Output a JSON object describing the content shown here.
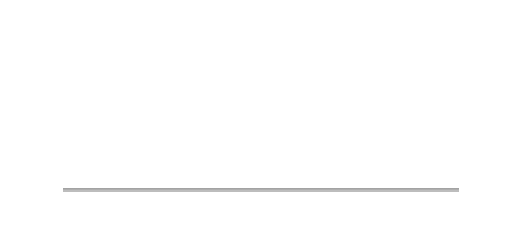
{
  "chart_data": {
    "type": "bar",
    "title": "",
    "xlabel": "",
    "ylabel": "",
    "grid": true,
    "legend": false,
    "categories": [
      "1986",
      "1987",
      "1988",
      "1989",
      "1990",
      "1991",
      "1992",
      "1993",
      "1994",
      "1995",
      "1996",
      "1997",
      "1998",
      "1999",
      "2000",
      "2001",
      "2002",
      "2003",
      "2004",
      "2005",
      "2006",
      "2007",
      "2008"
    ],
    "series": [
      {
        "name": "Average price",
        "render": "bar",
        "axis": "left",
        "unit": "GBP",
        "values": [
          47000,
          60000,
          81000,
          82000,
          70000,
          68000,
          62000,
          62000,
          66000,
          65000,
          69000,
          71000,
          78000,
          88000,
          100000,
          113000,
          131000,
          152000,
          168000,
          175000,
          193000,
          222000,
          185000
        ]
      },
      {
        "name": "Price per thousand",
        "render": "line",
        "axis": "right",
        "unit": "GBP/thousand",
        "values": [
          175,
          186,
          196,
          193,
          180,
          172,
          163,
          160,
          168,
          176,
          184,
          190,
          200,
          214,
          232,
          255,
          285,
          318,
          352,
          372,
          392,
          408,
          410
        ]
      }
    ],
    "y_axis_left": {
      "ticks": [
        "£200,000",
        "£150,000",
        "£100,000",
        "£50,000"
      ],
      "values": [
        200000,
        150000,
        100000,
        50000
      ],
      "min": 0,
      "max": 235000
    },
    "y_axis_right": {
      "ticks": [
        "£400/thousand",
        "£300/thousand",
        "£200/thousand",
        "£100/thousand"
      ],
      "values": [
        400,
        300,
        200,
        100
      ],
      "min": 0,
      "max": 470
    },
    "colors": {
      "bar_dark": "#1a1a1a",
      "bar_highlight": "#6d6d6d",
      "trend_line": "#2b2b2b",
      "trend_fill": "#8f8f8f",
      "plot_background_top": "#7e7e7e",
      "plot_background_bottom": "#eaeaea",
      "gridline": "#e8e8e8"
    }
  },
  "caption": {
    "text": ""
  }
}
